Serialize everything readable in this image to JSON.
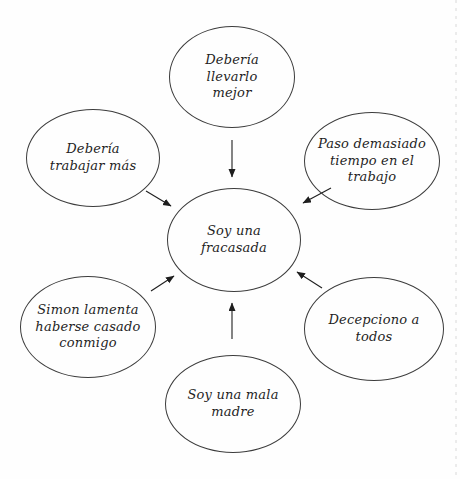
{
  "diagram": {
    "type": "radial-thought-diagram",
    "center_node_id": "soy-una-fracasada",
    "nodes": [
      {
        "id": "deberia-llevarlo-mejor",
        "label": "Debería\nllevarlo\nmejor",
        "cx": 232,
        "cy": 77,
        "rx": 63,
        "ry": 51
      },
      {
        "id": "deberia-trabajar-mas",
        "label": "Debería\ntrabajar más",
        "cx": 93,
        "cy": 158,
        "rx": 67,
        "ry": 49
      },
      {
        "id": "paso-demasiado-tiempo",
        "label": "Paso demasiado\ntiempo en el\ntrabajo",
        "cx": 372,
        "cy": 161,
        "rx": 68,
        "ry": 49
      },
      {
        "id": "soy-una-fracasada",
        "label": "Soy una\nfracasada",
        "cx": 234,
        "cy": 240,
        "rx": 67,
        "ry": 52
      },
      {
        "id": "simon-lamenta",
        "label": "Simon lamenta\nhaberse casado\nconmigo",
        "cx": 88,
        "cy": 327,
        "rx": 68,
        "ry": 51
      },
      {
        "id": "decepciono-a-todos",
        "label": "Decepciono a\ntodos",
        "cx": 374,
        "cy": 329,
        "rx": 70,
        "ry": 52
      },
      {
        "id": "soy-una-mala-madre",
        "label": "Soy una mala\nmadre",
        "cx": 233,
        "cy": 404,
        "rx": 68,
        "ry": 49
      }
    ],
    "arrows": [
      {
        "from": "deberia-llevarlo-mejor",
        "to": "soy-una-fracasada",
        "x1": 232,
        "y1": 140,
        "x2": 232,
        "y2": 177
      },
      {
        "from": "deberia-trabajar-mas",
        "to": "soy-una-fracasada",
        "x1": 146,
        "y1": 191,
        "x2": 171,
        "y2": 206
      },
      {
        "from": "paso-demasiado-tiempo",
        "to": "soy-una-fracasada",
        "x1": 331,
        "y1": 188,
        "x2": 303,
        "y2": 203
      },
      {
        "from": "simon-lamenta",
        "to": "soy-una-fracasada",
        "x1": 151,
        "y1": 291,
        "x2": 174,
        "y2": 276
      },
      {
        "from": "decepciono-a-todos",
        "to": "soy-una-fracasada",
        "x1": 322,
        "y1": 288,
        "x2": 297,
        "y2": 272
      },
      {
        "from": "soy-una-mala-madre",
        "to": "soy-una-fracasada",
        "x1": 232,
        "y1": 339,
        "x2": 232,
        "y2": 303
      }
    ]
  },
  "colors": {
    "ink": "#1e1e1e",
    "stroke": "#3c3c3c",
    "background": "#fefefe"
  }
}
